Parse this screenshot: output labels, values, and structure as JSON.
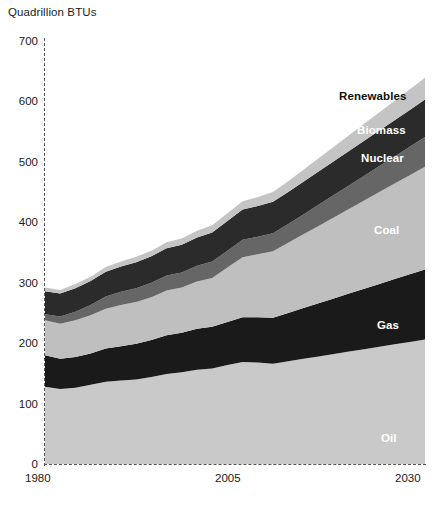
{
  "chart_data": {
    "type": "area",
    "stacked": true,
    "title": "Quadrillion BTUs",
    "xlabel": "",
    "ylabel": "Quadrillion BTUs",
    "xlim": [
      1980,
      2030
    ],
    "ylim": [
      0,
      700
    ],
    "yticks": [
      0,
      100,
      200,
      300,
      400,
      500,
      600,
      700
    ],
    "ytick_labels": [
      "0",
      "100",
      "200",
      "300",
      "400",
      "500",
      "600",
      "700"
    ],
    "xticks": [
      1980,
      2005,
      2030
    ],
    "xtick_labels": [
      "1980",
      "2005",
      "2030"
    ],
    "grid": false,
    "axis_style": "dashed",
    "legend_position": "inline-right",
    "x": [
      1980,
      1982,
      1984,
      1986,
      1988,
      1990,
      1992,
      1994,
      1996,
      1998,
      2000,
      2002,
      2004,
      2006,
      2008,
      2010,
      2012,
      2014,
      2016,
      2018,
      2020,
      2022,
      2024,
      2026,
      2028,
      2030
    ],
    "series": [
      {
        "name": "Oil",
        "color": "#c9c9c9",
        "label_color": "#ffffff",
        "values": [
          128,
          124,
          126,
          131,
          136,
          138,
          140,
          144,
          149,
          152,
          156,
          158,
          164,
          169,
          168,
          166,
          170,
          174,
          178,
          182,
          186,
          190,
          194,
          198,
          202,
          206
        ]
      },
      {
        "name": "Gas",
        "color": "#1a1a1a",
        "label_color": "#ffffff",
        "values": [
          52,
          50,
          51,
          52,
          55,
          57,
          59,
          61,
          64,
          65,
          68,
          69,
          71,
          74,
          75,
          76,
          80,
          84,
          88,
          92,
          96,
          100,
          104,
          108,
          112,
          116
        ]
      },
      {
        "name": "Coal",
        "color": "#bfbfbf",
        "label_color": "#ffffff",
        "values": [
          58,
          58,
          61,
          63,
          66,
          68,
          69,
          71,
          74,
          75,
          78,
          81,
          90,
          99,
          104,
          110,
          116,
          122,
          128,
          134,
          140,
          146,
          152,
          158,
          164,
          170
        ]
      },
      {
        "name": "Nuclear",
        "color": "#666666",
        "label_color": "#ffffff",
        "values": [
          10,
          12,
          14,
          17,
          20,
          22,
          23,
          24,
          25,
          25,
          26,
          27,
          28,
          29,
          29,
          30,
          31,
          33,
          35,
          37,
          39,
          41,
          43,
          45,
          47,
          49
        ]
      },
      {
        "name": "Biomass",
        "color": "#2b2b2b",
        "label_color": "#ffffff",
        "values": [
          38,
          38,
          39,
          40,
          41,
          42,
          43,
          44,
          45,
          46,
          47,
          48,
          49,
          50,
          51,
          52,
          53,
          54,
          55,
          56,
          57,
          58,
          59,
          60,
          61,
          62
        ]
      },
      {
        "name": "Renewables",
        "color": "#c4c4c4",
        "label_color": "#111111",
        "values": [
          6,
          6,
          7,
          7,
          8,
          8,
          9,
          9,
          10,
          10,
          11,
          12,
          13,
          14,
          15,
          16,
          18,
          20,
          22,
          24,
          26,
          28,
          30,
          32,
          34,
          36
        ]
      }
    ],
    "totals": [
      292,
      288,
      298,
      310,
      326,
      335,
      343,
      353,
      367,
      373,
      386,
      395,
      415,
      435,
      442,
      450,
      468,
      487,
      506,
      525,
      544,
      563,
      582,
      601,
      620,
      639
    ]
  },
  "labels": {
    "axis_title": "Quadrillion BTUs",
    "oil": "Oil",
    "gas": "Gas",
    "coal": "Coal",
    "nuclear": "Nuclear",
    "biomass": "Biomass",
    "renewables": "Renewables"
  },
  "ticks": {
    "y": [
      "700",
      "600",
      "500",
      "400",
      "300",
      "200",
      "100",
      "0"
    ],
    "x1980": "1980",
    "x2005": "2005",
    "x2030": "2030"
  }
}
